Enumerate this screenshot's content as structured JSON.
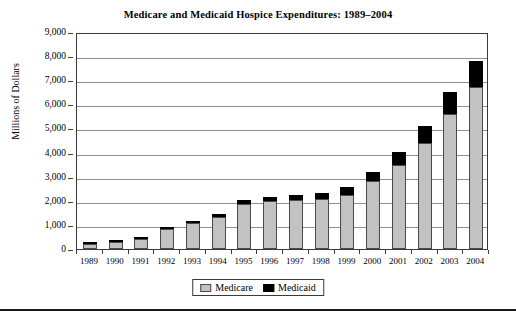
{
  "chart_data": {
    "type": "bar",
    "title": "Medicare and Medicaid Hospice Expenditures: 1989–2004",
    "xlabel": "",
    "ylabel": "Millions of Dollars",
    "ylim": [
      0,
      9000
    ],
    "ytick_labels": [
      "9,000",
      "8,000",
      "7,000",
      "6,000",
      "5,000",
      "4,000",
      "3,000",
      "2,000",
      "1,000",
      "0"
    ],
    "ytick_values": [
      9000,
      8000,
      7000,
      6000,
      5000,
      4000,
      3000,
      2000,
      1000,
      0
    ],
    "grid": true,
    "stacked": true,
    "legend_position": "bottom-center",
    "categories": [
      "1989",
      "1990",
      "1991",
      "1992",
      "1993",
      "1994",
      "1995",
      "1996",
      "1997",
      "1998",
      "1999",
      "2000",
      "2001",
      "2002",
      "2003",
      "2004"
    ],
    "series": [
      {
        "name": "Medicare",
        "color": "#c2c2c2",
        "values": [
          200,
          280,
          420,
          820,
          1080,
          1330,
          1870,
          1980,
          2050,
          2080,
          2240,
          2820,
          3480,
          4400,
          5600,
          6700
        ]
      },
      {
        "name": "Medicaid",
        "color": "#000000",
        "values": [
          20,
          30,
          40,
          80,
          100,
          120,
          150,
          160,
          180,
          250,
          350,
          380,
          560,
          720,
          900,
          1100
        ]
      }
    ],
    "totals": [
      220,
      310,
      460,
      900,
      1180,
      1450,
      2020,
      2140,
      2230,
      2330,
      2590,
      3200,
      4040,
      5120,
      6500,
      7800
    ]
  },
  "legend": {
    "entries": [
      {
        "label": "Medicare",
        "color": "#c2c2c2"
      },
      {
        "label": "Medicaid",
        "color": "#000000"
      }
    ]
  }
}
